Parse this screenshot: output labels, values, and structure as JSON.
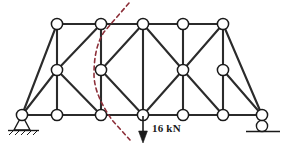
{
  "diagram": {
    "type": "truss-structural-diagram",
    "colors": {
      "member": "#2b2b2b",
      "node_fill": "#ffffff",
      "node_stroke": "#1a1a1a",
      "section_cut": "#8c2f39",
      "ground": "#1a1a1a",
      "background": "#ffffff"
    },
    "load": {
      "label": "16 kN",
      "magnitude": 16,
      "unit": "kN",
      "direction": "down",
      "applied_at_node": "B3"
    },
    "supports": [
      {
        "id": "support-pin",
        "kind": "pin",
        "at_node": "B0"
      },
      {
        "id": "support-roller",
        "kind": "roller",
        "at_node": "B6"
      }
    ],
    "section_cut": {
      "id": "section-cut-line",
      "style": "dashed",
      "color": "#8c2f39",
      "path": "M 129 3 L 104 32 C 96 44 94 60 94 74 C 94 92 104 108 112 120 L 130 140"
    },
    "nodes": [
      {
        "id": "T1",
        "x": 57,
        "y": 24,
        "chord": "top"
      },
      {
        "id": "T2",
        "x": 101,
        "y": 24,
        "chord": "top"
      },
      {
        "id": "T3",
        "x": 143,
        "y": 24,
        "chord": "top"
      },
      {
        "id": "T4",
        "x": 183,
        "y": 24,
        "chord": "top"
      },
      {
        "id": "T5",
        "x": 223,
        "y": 24,
        "chord": "top"
      },
      {
        "id": "M1",
        "x": 57,
        "y": 70,
        "chord": "middle"
      },
      {
        "id": "M2",
        "x": 101,
        "y": 70,
        "chord": "middle"
      },
      {
        "id": "M4",
        "x": 183,
        "y": 70,
        "chord": "middle"
      },
      {
        "id": "M5",
        "x": 223,
        "y": 70,
        "chord": "middle"
      },
      {
        "id": "B0",
        "x": 22,
        "y": 115,
        "chord": "bottom"
      },
      {
        "id": "B1",
        "x": 57,
        "y": 115,
        "chord": "bottom"
      },
      {
        "id": "B2",
        "x": 101,
        "y": 115,
        "chord": "bottom"
      },
      {
        "id": "B3",
        "x": 143,
        "y": 115,
        "chord": "bottom"
      },
      {
        "id": "B4",
        "x": 183,
        "y": 115,
        "chord": "bottom"
      },
      {
        "id": "B5",
        "x": 223,
        "y": 115,
        "chord": "bottom"
      },
      {
        "id": "B6",
        "x": 262,
        "y": 115,
        "chord": "bottom"
      }
    ],
    "members": [
      {
        "from": "T1",
        "to": "T2"
      },
      {
        "from": "T2",
        "to": "T3"
      },
      {
        "from": "T3",
        "to": "T4"
      },
      {
        "from": "T4",
        "to": "T5"
      },
      {
        "from": "B0",
        "to": "B1"
      },
      {
        "from": "B1",
        "to": "B2"
      },
      {
        "from": "B2",
        "to": "B3"
      },
      {
        "from": "B3",
        "to": "B4"
      },
      {
        "from": "B4",
        "to": "B5"
      },
      {
        "from": "B5",
        "to": "B6"
      },
      {
        "from": "T1",
        "to": "M1"
      },
      {
        "from": "M1",
        "to": "B1"
      },
      {
        "from": "T2",
        "to": "M2"
      },
      {
        "from": "M2",
        "to": "B2"
      },
      {
        "from": "T3",
        "to": "B3"
      },
      {
        "from": "T4",
        "to": "M4"
      },
      {
        "from": "M4",
        "to": "B4"
      },
      {
        "from": "T5",
        "to": "M5"
      },
      {
        "from": "M5",
        "to": "B5"
      },
      {
        "from": "T1",
        "to": "B0"
      },
      {
        "from": "B0",
        "to": "M1"
      },
      {
        "from": "T2",
        "to": "M1"
      },
      {
        "from": "M1",
        "to": "B2"
      },
      {
        "from": "T3",
        "to": "M2"
      },
      {
        "from": "M2",
        "to": "B3"
      },
      {
        "from": "T3",
        "to": "M4"
      },
      {
        "from": "M4",
        "to": "B3"
      },
      {
        "from": "T5",
        "to": "M4"
      },
      {
        "from": "M4",
        "to": "B5"
      },
      {
        "from": "T5",
        "to": "B6"
      },
      {
        "from": "M5",
        "to": "B6"
      }
    ]
  }
}
